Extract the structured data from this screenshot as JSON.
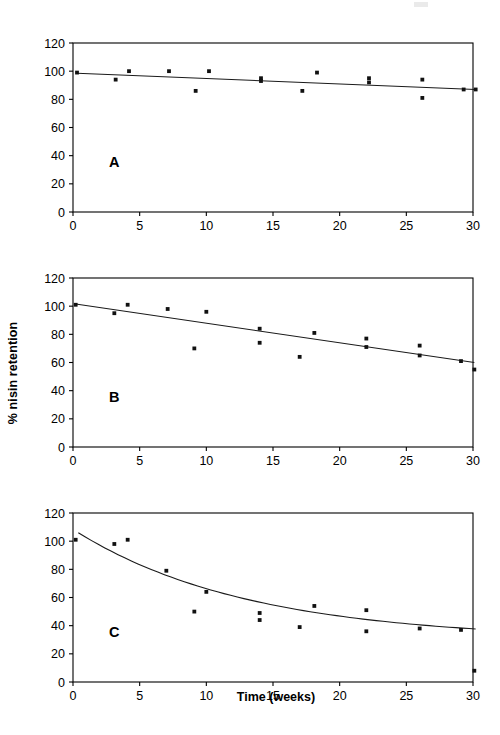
{
  "figure": {
    "axis_title_x": "Time (weeks)",
    "axis_title_y": "% nisin retention",
    "panel_labels": [
      "A",
      "B",
      "C"
    ],
    "colors": {
      "ink": "#000000",
      "axis": "#222222",
      "marker": "#111111",
      "line": "#1a1a1a"
    }
  },
  "axes": {
    "x_ticks": [
      "0",
      "5",
      "10",
      "15",
      "20",
      "25",
      "30"
    ],
    "y_ticks": [
      "0",
      "20",
      "40",
      "60",
      "80",
      "100",
      "120"
    ]
  },
  "chart_data": [
    {
      "type": "scatter",
      "panel": "A",
      "title": "",
      "xlabel": "Time (weeks)",
      "ylabel": "% nisin retention",
      "xlim": [
        0,
        30
      ],
      "ylim": [
        0,
        120
      ],
      "xticks": [
        0,
        5,
        10,
        15,
        20,
        25,
        30
      ],
      "yticks": [
        0,
        20,
        40,
        60,
        80,
        100,
        120
      ],
      "grid": false,
      "legend": "none",
      "points": [
        {
          "x": 0.3,
          "y": 99
        },
        {
          "x": 3.2,
          "y": 94
        },
        {
          "x": 4.2,
          "y": 100
        },
        {
          "x": 7.2,
          "y": 100
        },
        {
          "x": 9.2,
          "y": 86
        },
        {
          "x": 10.2,
          "y": 100
        },
        {
          "x": 14.1,
          "y": 95
        },
        {
          "x": 14.1,
          "y": 93
        },
        {
          "x": 17.2,
          "y": 86
        },
        {
          "x": 18.3,
          "y": 99
        },
        {
          "x": 22.2,
          "y": 95
        },
        {
          "x": 22.2,
          "y": 92
        },
        {
          "x": 26.2,
          "y": 94
        },
        {
          "x": 26.2,
          "y": 81
        },
        {
          "x": 29.3,
          "y": 87
        },
        {
          "x": 30.2,
          "y": 87
        }
      ],
      "fit_line": {
        "model": "linear",
        "x_start": 0.3,
        "y_start": 98.5,
        "x_end": 30.2,
        "y_end": 87.0
      }
    },
    {
      "type": "scatter",
      "panel": "B",
      "title": "",
      "xlabel": "Time (weeks)",
      "ylabel": "% nisin retention",
      "xlim": [
        0,
        30
      ],
      "ylim": [
        0,
        120
      ],
      "xticks": [
        0,
        5,
        10,
        15,
        20,
        25,
        30
      ],
      "yticks": [
        0,
        20,
        40,
        60,
        80,
        100,
        120
      ],
      "grid": false,
      "legend": "none",
      "points": [
        {
          "x": 0.2,
          "y": 101
        },
        {
          "x": 3.1,
          "y": 95
        },
        {
          "x": 4.1,
          "y": 101
        },
        {
          "x": 7.1,
          "y": 98
        },
        {
          "x": 9.1,
          "y": 70
        },
        {
          "x": 10.0,
          "y": 96
        },
        {
          "x": 14.0,
          "y": 84
        },
        {
          "x": 14.0,
          "y": 74
        },
        {
          "x": 17.0,
          "y": 64
        },
        {
          "x": 18.1,
          "y": 81
        },
        {
          "x": 22.0,
          "y": 77
        },
        {
          "x": 22.0,
          "y": 71
        },
        {
          "x": 26.0,
          "y": 72
        },
        {
          "x": 26.0,
          "y": 65
        },
        {
          "x": 29.1,
          "y": 61
        },
        {
          "x": 30.1,
          "y": 55
        }
      ],
      "fit_line": {
        "model": "linear",
        "x_start": 0.2,
        "y_start": 101.5,
        "x_end": 30.1,
        "y_end": 60.0
      }
    },
    {
      "type": "scatter",
      "panel": "C",
      "title": "",
      "xlabel": "Time (weeks)",
      "ylabel": "% nisin retention",
      "xlim": [
        0,
        30
      ],
      "ylim": [
        0,
        120
      ],
      "xticks": [
        0,
        5,
        10,
        15,
        20,
        25,
        30
      ],
      "yticks": [
        0,
        20,
        40,
        60,
        80,
        100,
        120
      ],
      "grid": false,
      "legend": "none",
      "points": [
        {
          "x": 0.2,
          "y": 101
        },
        {
          "x": 3.1,
          "y": 98
        },
        {
          "x": 4.1,
          "y": 101
        },
        {
          "x": 7.0,
          "y": 79
        },
        {
          "x": 9.1,
          "y": 50
        },
        {
          "x": 10.0,
          "y": 64
        },
        {
          "x": 14.0,
          "y": 49
        },
        {
          "x": 14.0,
          "y": 44
        },
        {
          "x": 17.0,
          "y": 39
        },
        {
          "x": 18.1,
          "y": 54
        },
        {
          "x": 22.0,
          "y": 51
        },
        {
          "x": 22.0,
          "y": 36
        },
        {
          "x": 26.0,
          "y": 38
        },
        {
          "x": 29.1,
          "y": 37
        },
        {
          "x": 30.1,
          "y": 8
        }
      ],
      "fit_line": {
        "model": "exponential_decay",
        "y0": 106,
        "y_end": 30,
        "x_start": 0.4,
        "x_end": 30.2,
        "k": 0.077
      }
    }
  ]
}
